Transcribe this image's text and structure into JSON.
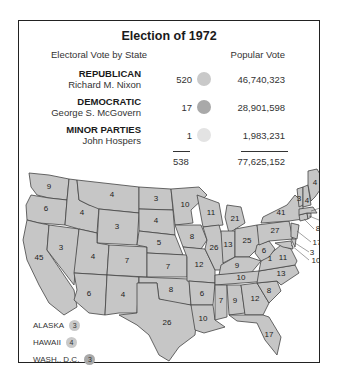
{
  "title": "Election of 1972",
  "headers": {
    "electoral": "Electoral Vote by State",
    "popular": "Popular Vote"
  },
  "colors": {
    "republican": "#c9c9c9",
    "democratic": "#a9a9a9",
    "minor": "#e3e3e3",
    "state_fill": "#c6c6c6",
    "state_border": "#444444"
  },
  "parties": [
    {
      "party": "REPUBLICAN",
      "candidate": "Richard M. Nixon",
      "electoral": "520",
      "popular": "46,740,323"
    },
    {
      "party": "DEMOCRATIC",
      "candidate": "George S. McGovern",
      "electoral": "17",
      "popular": "28,901,598"
    },
    {
      "party": "MINOR PARTIES",
      "candidate": "John Hospers",
      "electoral": "1",
      "popular": "1,983,231"
    }
  ],
  "totals": {
    "electoral": "538",
    "popular": "77,625,152"
  },
  "states": {
    "WA": "9",
    "OR": "6",
    "CA": "45",
    "NV": "3",
    "ID": "4",
    "MT": "4",
    "WY": "3",
    "UT": "4",
    "AZ": "6",
    "CO": "7",
    "NM": "4",
    "ND": "3",
    "SD": "4",
    "NE": "5",
    "KS": "7",
    "OK": "8",
    "TX": "26",
    "MN": "10",
    "IA": "8",
    "MO": "12",
    "AR": "6",
    "LA": "10",
    "WI": "11",
    "IL": "26",
    "MI": "21",
    "IN": "13",
    "OH": "25",
    "KY": "9",
    "TN": "10",
    "MS": "7",
    "AL": "9",
    "GA": "12",
    "FL": "17",
    "SC": "8",
    "NC": "13",
    "VA": "11",
    "VA_minor": "1",
    "WV": "6",
    "PA": "27",
    "NY": "41",
    "ME": "4",
    "VT": "3",
    "NH": "4",
    "MA": "14",
    "RI": "4",
    "CT": "8",
    "NJ": "17",
    "DE": "3",
    "MD": "10"
  },
  "legend": [
    {
      "label": "ALASKA",
      "value": "3"
    },
    {
      "label": "HAWAII",
      "value": "4"
    },
    {
      "label": "WASH., D.C.",
      "value": "3"
    }
  ]
}
